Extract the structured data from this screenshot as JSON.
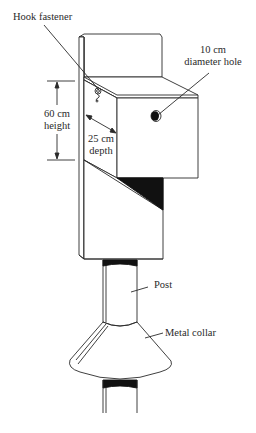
{
  "diagram": {
    "labels": {
      "hook_fastener": "Hook fastener",
      "hole_line1": "10 cm",
      "hole_line2": "diameter hole",
      "height_line1": "60 cm",
      "height_line2": "height",
      "depth_line1": "25 cm",
      "depth_line2": "depth",
      "post": "Post",
      "metal_collar": "Metal collar"
    },
    "colors": {
      "stroke": "#2a2a2a",
      "fill": "#ffffff",
      "shadow": "#111111"
    }
  }
}
